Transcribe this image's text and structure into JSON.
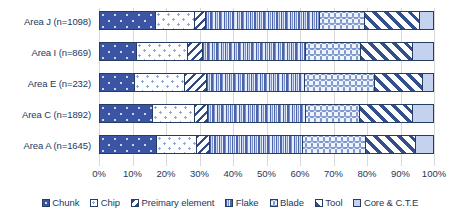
{
  "chart_data": {
    "type": "bar",
    "orientation": "horizontal",
    "stacked": true,
    "normalized": "percent",
    "title": "",
    "subtitle": "",
    "xlabel": "",
    "ylabel": "",
    "xlim": [
      0,
      100
    ],
    "xticks": [
      "0%",
      "10%",
      "20%",
      "30%",
      "40%",
      "50%",
      "60%",
      "70%",
      "80%",
      "90%",
      "100%"
    ],
    "xtick_values": [
      0,
      10,
      20,
      30,
      40,
      50,
      60,
      70,
      80,
      90,
      100
    ],
    "grid": true,
    "grid_axis": "x",
    "legend_position": "bottom",
    "categories": [
      "Area J (n=1098)",
      "Area I (n=869)",
      "Area E (n=232)",
      "Area C (n=1892)",
      "Area A (n=1645)"
    ],
    "series": [
      {
        "name": "Chunk",
        "pattern": "dotted-solid-dark-blue",
        "color": "#3b55a4",
        "values": [
          16.8,
          11.0,
          10.5,
          15.8,
          17.0
        ]
      },
      {
        "name": "Chip",
        "pattern": "white-small-dots",
        "color": "#ffffff",
        "values": [
          11.7,
          15.5,
          15.0,
          12.7,
          12.0
        ]
      },
      {
        "name": "Preimary element",
        "pattern": "back-diagonal-stripes",
        "color": "#2f4a84",
        "values": [
          3.3,
          4.5,
          6.5,
          4.0,
          4.0
        ]
      },
      {
        "name": "Flake",
        "pattern": "vertical-stripes",
        "color": "#4a63ab",
        "values": [
          34.2,
          31.0,
          29.5,
          29.5,
          28.0
        ]
      },
      {
        "name": "Blade",
        "pattern": "wavy-scale-light",
        "color": "#7e97cd",
        "values": [
          13.5,
          16.5,
          21.0,
          16.0,
          19.0
        ]
      },
      {
        "name": "Tool",
        "pattern": "forward-diagonal-hatch",
        "color": "#33508c",
        "values": [
          16.5,
          15.5,
          14.5,
          16.0,
          15.0
        ]
      },
      {
        "name": "Core & C.T.E",
        "pattern": "solid-light-blue",
        "color": "#c4d2ef",
        "values": [
          4.0,
          6.0,
          3.0,
          6.0,
          5.0
        ]
      }
    ]
  },
  "legend": {
    "items": [
      {
        "label": "Chunk"
      },
      {
        "label": "Chip"
      },
      {
        "label": "Preimary element"
      },
      {
        "label": "Flake"
      },
      {
        "label": "Blade"
      },
      {
        "label": "Tool"
      },
      {
        "label": "Core & C.T.E"
      }
    ]
  }
}
